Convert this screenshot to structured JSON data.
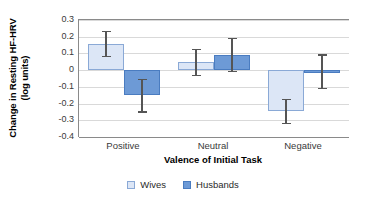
{
  "chart_data": {
    "type": "bar",
    "title": "",
    "xlabel": "Valence of Initial Task",
    "ylabel": "Change in Resting HF-HRV (log units)",
    "ylabel_line1": "Change in Resting HF-HRV",
    "ylabel_line2": "(log units)",
    "categories": [
      "Positive",
      "Neutral",
      "Negative"
    ],
    "ylim": [
      -0.4,
      0.3
    ],
    "ytick_labels": [
      "0.3",
      "0.2",
      "0.1",
      "0",
      "-0.1",
      "-0.2",
      "-0.3",
      "-0.4"
    ],
    "ytick_values": [
      0.3,
      0.2,
      0.1,
      0,
      -0.1,
      -0.2,
      -0.3,
      -0.4
    ],
    "grid": true,
    "legend_position": "bottom",
    "series": [
      {
        "name": "Wives",
        "color": "#dce6f6",
        "border_color": "#8aa9d6",
        "values": [
          0.155,
          0.05,
          -0.245
        ],
        "err_low": [
          0.08,
          -0.03,
          -0.32
        ],
        "err_high": [
          0.23,
          0.125,
          -0.175
        ]
      },
      {
        "name": "Husbands",
        "color": "#6d9ad6",
        "border_color": "#4a7cc0",
        "values": [
          -0.15,
          0.09,
          -0.01
        ],
        "err_low": [
          -0.25,
          -0.01,
          -0.11
        ],
        "err_high": [
          -0.055,
          0.19,
          0.09
        ]
      }
    ]
  },
  "legend": {
    "items": [
      {
        "label": "Wives"
      },
      {
        "label": "Husbands"
      }
    ]
  }
}
